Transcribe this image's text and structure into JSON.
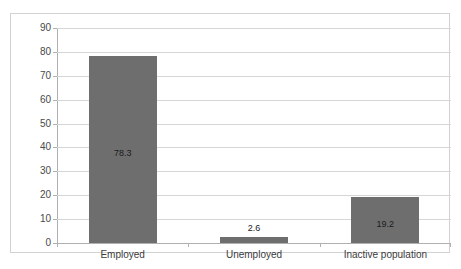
{
  "chart_data": {
    "type": "bar",
    "title": "",
    "subtitle": "",
    "xlabel": "",
    "ylabel": "",
    "categories": [
      "Employed",
      "Unemployed",
      "Inactive population"
    ],
    "values": [
      78.3,
      2.6,
      19.2
    ],
    "data_labels": [
      "78.3",
      "2.6",
      "19.2"
    ],
    "ylim": [
      0,
      90
    ],
    "yticks": [
      0,
      10,
      20,
      30,
      40,
      50,
      60,
      70,
      80,
      90
    ],
    "ytick_labels": [
      "0",
      "10",
      "20",
      "30",
      "40",
      "50",
      "60",
      "70",
      "80",
      "90"
    ],
    "grid": true,
    "grid_axis": "y",
    "legend": false,
    "legend_position": "none",
    "series": [
      {
        "name": "",
        "values": [
          78.3,
          2.6,
          19.2
        ],
        "color": "#6e6e6e"
      }
    ]
  },
  "style": {
    "bar_color": "#6e6e6e",
    "gridline_color": "#d6d6d6",
    "axis_color": "#b0b0b0",
    "frame_color": "#d2d2d2",
    "background": "#ffffff",
    "label_color": "#3b3b3b",
    "value_label_color": "#1a1a1a"
  }
}
